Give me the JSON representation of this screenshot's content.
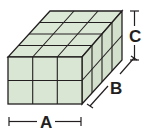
{
  "diagram": {
    "type": "rectangular-prism-unit-cubes",
    "front_columns": 3,
    "front_rows": 2,
    "depth_cubes": 4,
    "labels": {
      "width": "A",
      "depth": "B",
      "height": "C"
    },
    "colors": {
      "face": "#d9e6d3",
      "top": "#dce8d6",
      "side": "#d3e0cc",
      "line": "#231f20"
    }
  }
}
